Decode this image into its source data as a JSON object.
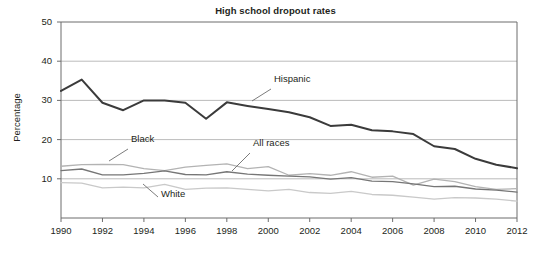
{
  "chart_data": {
    "type": "line",
    "title": "High school dropout rates",
    "xlabel": "",
    "ylabel": "Percentage",
    "xlim": [
      1990,
      2012
    ],
    "ylim": [
      0,
      50
    ],
    "ytick_values": [
      10,
      20,
      30,
      40,
      50
    ],
    "ytick_labels": [
      "10",
      "20",
      "30",
      "40",
      "50"
    ],
    "xtick_values": [
      1990,
      1992,
      1994,
      1996,
      1998,
      2000,
      2002,
      2004,
      2006,
      2008,
      2010,
      2012
    ],
    "xtick_labels": [
      "1990",
      "1992",
      "1994",
      "1996",
      "1998",
      "2000",
      "2002",
      "2004",
      "2006",
      "2008",
      "2010",
      "2012"
    ],
    "grid": "horizontal",
    "legend_position": "inline-annotations",
    "x": [
      1990,
      1991,
      1992,
      1993,
      1994,
      1995,
      1996,
      1997,
      1998,
      1999,
      2000,
      2001,
      2002,
      2003,
      2004,
      2005,
      2006,
      2007,
      2008,
      2009,
      2010,
      2011,
      2012
    ],
    "series": [
      {
        "name": "Hispanic",
        "color": "#3b3b3b",
        "width": 2.0,
        "values": [
          32.4,
          35.3,
          29.4,
          27.5,
          30.0,
          30.0,
          29.4,
          25.3,
          29.5,
          28.6,
          27.8,
          27.0,
          25.7,
          23.5,
          23.8,
          22.4,
          22.1,
          21.4,
          18.3,
          17.6,
          15.1,
          13.6,
          12.7
        ]
      },
      {
        "name": "Black",
        "color": "#b3b3b3",
        "width": 1.3,
        "values": [
          13.2,
          13.6,
          13.7,
          13.6,
          12.6,
          12.1,
          13.0,
          13.4,
          13.8,
          12.6,
          13.1,
          10.9,
          11.3,
          10.9,
          11.8,
          10.4,
          10.7,
          8.4,
          9.9,
          9.3,
          8.0,
          7.3,
          7.5
        ]
      },
      {
        "name": "All races",
        "color": "#767676",
        "width": 1.3,
        "values": [
          12.1,
          12.5,
          11.0,
          11.0,
          11.4,
          12.0,
          11.1,
          11.0,
          11.8,
          11.2,
          10.9,
          10.7,
          10.5,
          9.9,
          10.3,
          9.4,
          9.3,
          8.7,
          8.0,
          8.1,
          7.4,
          7.1,
          6.6
        ]
      },
      {
        "name": "White",
        "color": "#c9c9c9",
        "width": 1.3,
        "values": [
          9.0,
          8.9,
          7.7,
          7.9,
          7.7,
          8.6,
          7.3,
          7.6,
          7.7,
          7.3,
          6.9,
          7.3,
          6.5,
          6.3,
          6.8,
          6.0,
          5.8,
          5.3,
          4.8,
          5.2,
          5.1,
          4.8,
          4.3
        ]
      }
    ],
    "annotations": [
      {
        "name": "Hispanic",
        "label_x": 274,
        "label_y": 80,
        "leader": [
          [
            271,
            89
          ],
          [
            252,
            101
          ]
        ]
      },
      {
        "name": "Black",
        "label_x": 131,
        "label_y": 140,
        "leader": [
          [
            128,
            149
          ],
          [
            109,
            161
          ]
        ]
      },
      {
        "name": "All races",
        "label_x": 253,
        "label_y": 144,
        "leader": [
          [
            250,
            153
          ],
          [
            232,
            171
          ]
        ]
      },
      {
        "name": "White",
        "label_x": 161,
        "label_y": 195,
        "leader": [
          [
            158,
            197
          ],
          [
            143,
            184
          ]
        ]
      }
    ]
  }
}
